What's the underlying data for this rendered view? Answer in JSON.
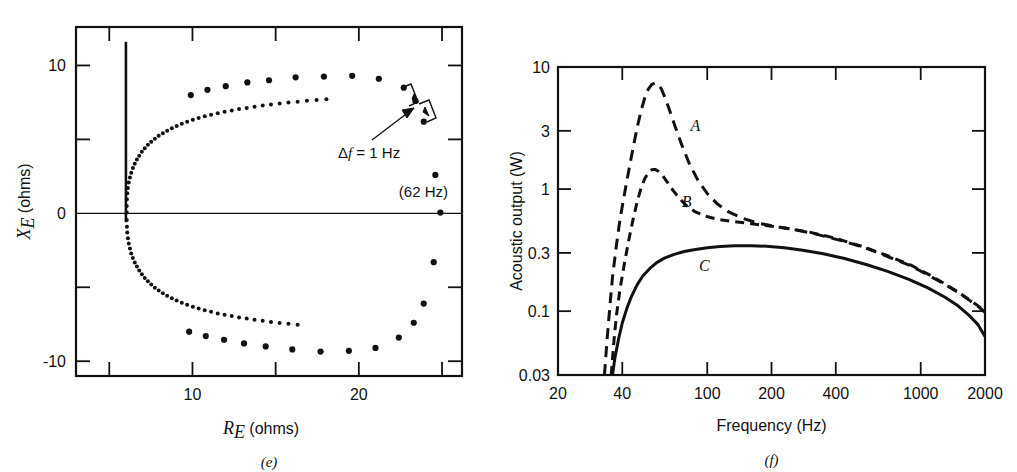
{
  "figure": {
    "panels": [
      {
        "id": "e",
        "caption": "(e)"
      },
      {
        "id": "f",
        "caption": "(f)"
      }
    ]
  },
  "chart_data": [
    {
      "id": "panel-e",
      "type": "scatter",
      "title": "",
      "caption": "(e)",
      "xlabel": "R_E (ohms)",
      "xlabel_parts": {
        "symbol": "R",
        "subscript": "E",
        "units": "(ohms)"
      },
      "ylabel": "X_E (ohms)",
      "ylabel_parts": {
        "symbol": "X",
        "subscript": "E",
        "units": "(ohms)"
      },
      "xlim": [
        3.0,
        26.2
      ],
      "ylim": [
        -11.0,
        12.6
      ],
      "xticks": [
        5,
        10,
        15,
        20,
        25
      ],
      "xtick_labels": [
        "",
        "10",
        "",
        "20",
        ""
      ],
      "yticks": [
        10,
        5,
        0,
        -5,
        -10
      ],
      "ytick_labels": [
        "10",
        "",
        "0",
        "",
        "-10"
      ],
      "grid": false,
      "zero_line": true,
      "annotations": [
        {
          "name": "delta-f-annotation",
          "text": "Δf = 1 Hz",
          "x": 15.7,
          "y": 3.6
        },
        {
          "name": "resonance-frequency-annotation",
          "text": "(62 Hz)",
          "x": 20.6,
          "y": 0.85
        }
      ],
      "spike": {
        "x": 6.0,
        "y_top": 11.6,
        "y_bottom": -0.6
      },
      "series": [
        {
          "name": "electrical impedance locus",
          "marker": "filled-circle",
          "points": [
            [
              6.05,
              0.05
            ],
            [
              6.05,
              0.5
            ],
            [
              6.06,
              0.95
            ],
            [
              6.08,
              1.35
            ],
            [
              6.12,
              1.72
            ],
            [
              6.17,
              2.08
            ],
            [
              6.24,
              2.42
            ],
            [
              6.32,
              2.75
            ],
            [
              6.42,
              3.06
            ],
            [
              6.53,
              3.36
            ],
            [
              6.66,
              3.64
            ],
            [
              6.8,
              3.9
            ],
            [
              6.96,
              4.16
            ],
            [
              7.13,
              4.4
            ],
            [
              7.32,
              4.63
            ],
            [
              7.52,
              4.84
            ],
            [
              7.74,
              5.05
            ],
            [
              7.97,
              5.24
            ],
            [
              8.22,
              5.42
            ],
            [
              8.48,
              5.59
            ],
            [
              8.76,
              5.76
            ],
            [
              9.05,
              5.91
            ],
            [
              9.36,
              6.05
            ],
            [
              9.68,
              6.19
            ],
            [
              10.02,
              6.32
            ],
            [
              10.37,
              6.44
            ],
            [
              10.74,
              6.56
            ],
            [
              11.12,
              6.67
            ],
            [
              11.52,
              6.77
            ],
            [
              11.93,
              6.87
            ],
            [
              12.36,
              6.96
            ],
            [
              12.8,
              7.05
            ],
            [
              13.26,
              7.13
            ],
            [
              13.73,
              7.21
            ],
            [
              14.22,
              7.29
            ],
            [
              14.72,
              7.36
            ],
            [
              15.24,
              7.43
            ],
            [
              15.77,
              7.49
            ],
            [
              16.32,
              7.55
            ],
            [
              16.88,
              7.61
            ],
            [
              17.46,
              7.66
            ],
            [
              18.05,
              7.71
            ],
            [
              6.05,
              -0.45
            ],
            [
              6.06,
              -0.9
            ],
            [
              6.08,
              -1.3
            ],
            [
              6.12,
              -1.68
            ],
            [
              6.17,
              -2.04
            ],
            [
              6.24,
              -2.38
            ],
            [
              6.32,
              -2.71
            ],
            [
              6.42,
              -3.02
            ],
            [
              6.53,
              -3.32
            ],
            [
              6.66,
              -3.6
            ],
            [
              6.8,
              -3.87
            ],
            [
              6.96,
              -4.12
            ],
            [
              7.13,
              -4.37
            ],
            [
              7.32,
              -4.6
            ],
            [
              7.52,
              -4.82
            ],
            [
              7.74,
              -5.03
            ],
            [
              7.97,
              -5.22
            ],
            [
              8.22,
              -5.41
            ],
            [
              8.48,
              -5.58
            ],
            [
              8.76,
              -5.74
            ],
            [
              9.05,
              -5.9
            ],
            [
              9.36,
              -6.04
            ],
            [
              9.68,
              -6.18
            ],
            [
              10.02,
              -6.31
            ],
            [
              10.37,
              -6.44
            ],
            [
              10.74,
              -6.55
            ],
            [
              11.12,
              -6.66
            ],
            [
              11.52,
              -6.77
            ],
            [
              11.93,
              -6.86
            ],
            [
              12.36,
              -6.95
            ],
            [
              12.8,
              -7.04
            ],
            [
              13.26,
              -7.12
            ],
            [
              13.73,
              -7.2
            ],
            [
              14.22,
              -7.27
            ],
            [
              14.72,
              -7.34
            ],
            [
              15.24,
              -7.41
            ],
            [
              15.77,
              -7.47
            ],
            [
              16.32,
              -7.53
            ]
          ],
          "coarse_points_upper": [
            [
              9.9,
              8.0
            ],
            [
              10.9,
              8.35
            ],
            [
              12.0,
              8.6
            ],
            [
              13.3,
              8.85
            ],
            [
              14.6,
              9.0
            ],
            [
              16.2,
              9.2
            ],
            [
              17.9,
              9.25
            ],
            [
              19.6,
              9.3
            ],
            [
              21.2,
              9.1
            ],
            [
              22.7,
              8.5
            ],
            [
              23.4,
              7.6
            ],
            [
              23.9,
              6.2
            ],
            [
              24.6,
              2.6
            ],
            [
              24.9,
              0.05
            ]
          ],
          "coarse_points_lower": [
            [
              9.8,
              -8.0
            ],
            [
              10.8,
              -8.3
            ],
            [
              11.9,
              -8.55
            ],
            [
              13.1,
              -8.8
            ],
            [
              14.4,
              -9.0
            ],
            [
              16.0,
              -9.2
            ],
            [
              17.7,
              -9.35
            ],
            [
              19.4,
              -9.3
            ],
            [
              21.0,
              -9.1
            ],
            [
              22.4,
              -8.4
            ],
            [
              23.3,
              -7.4
            ],
            [
              23.9,
              -6.1
            ],
            [
              24.5,
              -3.3
            ]
          ]
        }
      ]
    },
    {
      "id": "panel-f",
      "type": "line",
      "title": "",
      "caption": "(f)",
      "xlabel": "Frequency (Hz)",
      "ylabel": "Acoustic output (W)",
      "xscale": "log",
      "yscale": "log",
      "xlim": [
        20,
        2000
      ],
      "ylim": [
        0.03,
        10
      ],
      "xticks": [
        20,
        40,
        100,
        200,
        400,
        1000,
        2000
      ],
      "xtick_labels": [
        "20",
        "40",
        "100",
        "200",
        "400",
        "1000",
        "2000"
      ],
      "yticks": [
        10,
        3,
        1,
        0.3,
        0.1,
        0.03
      ],
      "ytick_labels": [
        "10",
        "3",
        "1",
        "0.3",
        "0.1",
        "0.03"
      ],
      "grid": false,
      "series": [
        {
          "name": "A",
          "label": "A",
          "style": "dashed",
          "label_position": {
            "x": 88,
            "y": 3.0
          },
          "points": [
            [
              33.0,
              0.03
            ],
            [
              34.0,
              0.06
            ],
            [
              35.0,
              0.11
            ],
            [
              36.0,
              0.19
            ],
            [
              37.5,
              0.34
            ],
            [
              39.0,
              0.56
            ],
            [
              41.0,
              0.92
            ],
            [
              43.0,
              1.45
            ],
            [
              45.0,
              2.2
            ],
            [
              47.0,
              3.2
            ],
            [
              49.0,
              4.4
            ],
            [
              51.0,
              5.6
            ],
            [
              53.0,
              6.6
            ],
            [
              55.0,
              7.2
            ],
            [
              57.0,
              7.4
            ],
            [
              59.0,
              7.2
            ],
            [
              61.0,
              6.6
            ],
            [
              64.0,
              5.4
            ],
            [
              67.0,
              4.3
            ],
            [
              71.0,
              3.2
            ],
            [
              76.0,
              2.3
            ],
            [
              82.0,
              1.65
            ],
            [
              90.0,
              1.2
            ],
            [
              100.0,
              0.92
            ],
            [
              112.0,
              0.75
            ],
            [
              126.0,
              0.65
            ],
            [
              145.0,
              0.58
            ],
            [
              170.0,
              0.53
            ],
            [
              200.0,
              0.5
            ],
            [
              250.0,
              0.47
            ],
            [
              320.0,
              0.43
            ],
            [
              420.0,
              0.38
            ],
            [
              550.0,
              0.33
            ],
            [
              700.0,
              0.28
            ],
            [
              900.0,
              0.235
            ],
            [
              1100.0,
              0.195
            ],
            [
              1300.0,
              0.165
            ],
            [
              1500.0,
              0.142
            ],
            [
              1700.0,
              0.122
            ],
            [
              1850.0,
              0.11
            ],
            [
              2000.0,
              0.098
            ]
          ]
        },
        {
          "name": "B",
          "label": "B",
          "style": "dashed",
          "label_position": {
            "x": 80,
            "y": 0.72
          },
          "points": [
            [
              35.5,
              0.03
            ],
            [
              36.5,
              0.055
            ],
            [
              37.5,
              0.09
            ],
            [
              39.0,
              0.15
            ],
            [
              41.0,
              0.25
            ],
            [
              43.0,
              0.39
            ],
            [
              45.0,
              0.57
            ],
            [
              47.0,
              0.79
            ],
            [
              49.0,
              1.02
            ],
            [
              51.0,
              1.22
            ],
            [
              53.0,
              1.36
            ],
            [
              55.0,
              1.44
            ],
            [
              57.0,
              1.45
            ],
            [
              59.0,
              1.4
            ],
            [
              62.0,
              1.28
            ],
            [
              65.0,
              1.14
            ],
            [
              69.0,
              0.98
            ],
            [
              74.0,
              0.84
            ],
            [
              80.0,
              0.73
            ],
            [
              88.0,
              0.65
            ],
            [
              98.0,
              0.6
            ],
            [
              112.0,
              0.565
            ],
            [
              130.0,
              0.545
            ],
            [
              155.0,
              0.525
            ],
            [
              185.0,
              0.505
            ],
            [
              230.0,
              0.48
            ],
            [
              300.0,
              0.445
            ],
            [
              400.0,
              0.395
            ],
            [
              530.0,
              0.34
            ],
            [
              700.0,
              0.285
            ],
            [
              900.0,
              0.238
            ],
            [
              1100.0,
              0.198
            ],
            [
              1300.0,
              0.167
            ],
            [
              1500.0,
              0.143
            ],
            [
              1700.0,
              0.123
            ],
            [
              1850.0,
              0.111
            ],
            [
              2000.0,
              0.099
            ]
          ]
        },
        {
          "name": "C",
          "label": "C",
          "style": "solid",
          "label_position": {
            "x": 97,
            "y": 0.215
          },
          "points": [
            [
              36.0,
              0.03
            ],
            [
              37.0,
              0.042
            ],
            [
              38.5,
              0.06
            ],
            [
              40.0,
              0.08
            ],
            [
              42.0,
              0.105
            ],
            [
              44.0,
              0.13
            ],
            [
              47.0,
              0.165
            ],
            [
              50.0,
              0.195
            ],
            [
              54.0,
              0.225
            ],
            [
              58.0,
              0.25
            ],
            [
              63.0,
              0.272
            ],
            [
              70.0,
              0.292
            ],
            [
              78.0,
              0.308
            ],
            [
              88.0,
              0.32
            ],
            [
              100.0,
              0.33
            ],
            [
              115.0,
              0.338
            ],
            [
              135.0,
              0.343
            ],
            [
              160.0,
              0.344
            ],
            [
              190.0,
              0.34
            ],
            [
              230.0,
              0.33
            ],
            [
              280.0,
              0.315
            ],
            [
              350.0,
              0.295
            ],
            [
              440.0,
              0.27
            ],
            [
              560.0,
              0.24
            ],
            [
              700.0,
              0.212
            ],
            [
              880.0,
              0.182
            ],
            [
              1080.0,
              0.155
            ],
            [
              1300.0,
              0.13
            ],
            [
              1500.0,
              0.11
            ],
            [
              1700.0,
              0.091
            ],
            [
              1850.0,
              0.078
            ],
            [
              2000.0,
              0.062
            ]
          ]
        }
      ]
    }
  ]
}
